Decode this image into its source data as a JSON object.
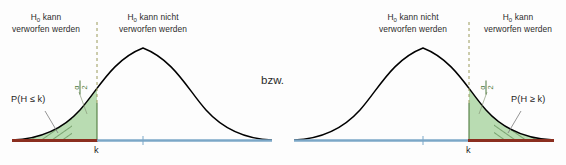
{
  "figure": {
    "connector_text": "bzw.",
    "background_color": "#fdfdfd",
    "curve_color": "#000000",
    "fill_color": "#b9dcb2",
    "hatch_color": "#3c6b30",
    "reject_axis_color": "#8b2e1f",
    "accept_axis_color": "#7ba7c7",
    "boundary_line_color": "#9a9a5a",
    "alpha_label_color": "#4f7a3e"
  },
  "left_chart": {
    "name": "left-tailed-test",
    "region_reject_label_line1": "H0 kann",
    "region_reject_label_line2": "verworfen werden",
    "region_accept_label_line1": "H0 kann nicht",
    "region_accept_label_line2": "verworfen werden",
    "probability_label": "P(H ≤ k)",
    "alpha_numerator": "α",
    "alpha_denominator": "2",
    "critical_value_label": "k",
    "tail_side": "left"
  },
  "right_chart": {
    "name": "right-tailed-test",
    "region_accept_label_line1": "H0 kann nicht",
    "region_accept_label_line2": "verworfen werden",
    "region_reject_label_line1": "H0 kann",
    "region_reject_label_line2": "verworfen werden",
    "probability_label": "P(H ≥ k)",
    "alpha_numerator": "α",
    "alpha_denominator": "2",
    "critical_value_label": "k",
    "tail_side": "right"
  },
  "chart_data": {
    "type": "area",
    "title": "",
    "xlabel": "",
    "ylabel": "",
    "charts": [
      {
        "id": "left",
        "distribution": "normal",
        "mean_x_px": 143,
        "sd_x_px": 42,
        "critical_value_x_px": 97,
        "critical_value_label": "k",
        "rejection_region": "x <= k",
        "rejection_area_label": "α/2",
        "tail_probability_label": "P(H ≤ k)",
        "axis_segments": [
          {
            "label": "rejection",
            "color": "#8b2e1f",
            "from_x_px": 12,
            "to_x_px": 97
          },
          {
            "label": "acceptance",
            "color": "#7ba7c7",
            "from_x_px": 97,
            "to_x_px": 272
          }
        ],
        "annotations": [
          {
            "text": "H0 kann verworfen werden",
            "region": "left-of-k"
          },
          {
            "text": "H0 kann nicht verworfen werden",
            "region": "right-of-k"
          }
        ]
      },
      {
        "id": "right",
        "distribution": "normal",
        "mean_x_px": 423,
        "sd_x_px": 42,
        "critical_value_x_px": 469,
        "critical_value_label": "k",
        "rejection_region": "x >= k",
        "rejection_area_label": "α/2",
        "tail_probability_label": "P(H ≥ k)",
        "axis_segments": [
          {
            "label": "acceptance",
            "color": "#7ba7c7",
            "from_x_px": 294,
            "to_x_px": 469
          },
          {
            "label": "rejection",
            "color": "#8b2e1f",
            "from_x_px": 469,
            "to_x_px": 554
          }
        ],
        "annotations": [
          {
            "text": "H0 kann nicht verworfen werden",
            "region": "left-of-k"
          },
          {
            "text": "H0 kann verworfen werden",
            "region": "right-of-k"
          }
        ]
      }
    ]
  }
}
